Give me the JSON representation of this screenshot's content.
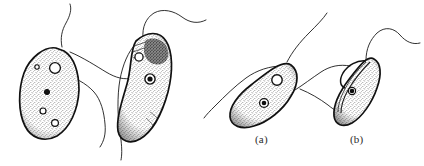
{
  "figure": {
    "background_color": "#ffffff",
    "ink_color": "#1a1a1a",
    "caption_fragment": "",
    "panels": [
      {
        "id": "a",
        "label": "(a)"
      },
      {
        "id": "b",
        "label": "(b)"
      }
    ],
    "organisms": [
      {
        "name": "cell-left-oval",
        "shape": "broad oval / pear",
        "body_fill": "stipple",
        "vacuoles": 4,
        "nucleus": 1,
        "flagella": 2
      },
      {
        "name": "cell-crescent",
        "shape": "crescent / banana",
        "body_fill": "stipple",
        "vacuoles": 1,
        "nucleus": 1,
        "dark_patch": 1,
        "flagella": 2
      },
      {
        "name": "cell-panel-a",
        "shape": "tilted bean",
        "body_fill": "stipple",
        "vacuoles": 1,
        "nucleus": 1,
        "flagella": 2
      },
      {
        "name": "cell-panel-b",
        "shape": "tilted ovoid with groove",
        "body_fill": "stipple",
        "vacuoles": 0,
        "nucleus": 1,
        "flagella": 2
      }
    ]
  }
}
